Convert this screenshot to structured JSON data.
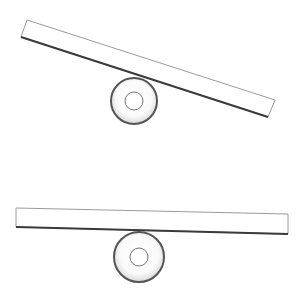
{
  "diagram": {
    "colors": {
      "background": "#ffffff",
      "outline_light": "#9a9a9a",
      "outline_dark": "#3a3a3a",
      "fill": "#ffffff"
    },
    "levers": [
      {
        "id": "tilted",
        "plank": {
          "points": "27,20 275,100 268,117 21,37"
        },
        "fulcrum": {
          "cx": 134,
          "cy": 101,
          "outer_r": 23,
          "inner_r": 9
        }
      },
      {
        "id": "level",
        "plank": {
          "points": "16,208 288,214 288,234 16,227"
        },
        "fulcrum": {
          "cx": 139,
          "cy": 257,
          "outer_r": 25,
          "inner_r": 9
        }
      }
    ]
  }
}
